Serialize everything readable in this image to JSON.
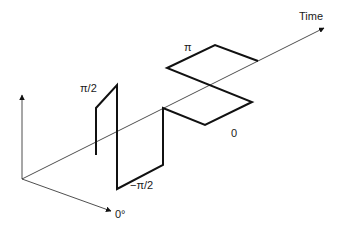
{
  "diagram": {
    "type": "3D phase waveform (QPSK-style constellation over time)",
    "axes": {
      "time_label": "Time",
      "phase_zero_label": "0°"
    },
    "phase_labels": {
      "pi_over_2": "π/2",
      "minus_pi_over_2": "−π/2",
      "pi": "π",
      "zero": "0"
    },
    "sequence": [
      "π/2",
      "−π/2",
      "0",
      "π"
    ],
    "colors": {
      "waveform": "#111111",
      "axes": "#222222",
      "background": "#ffffff"
    }
  }
}
